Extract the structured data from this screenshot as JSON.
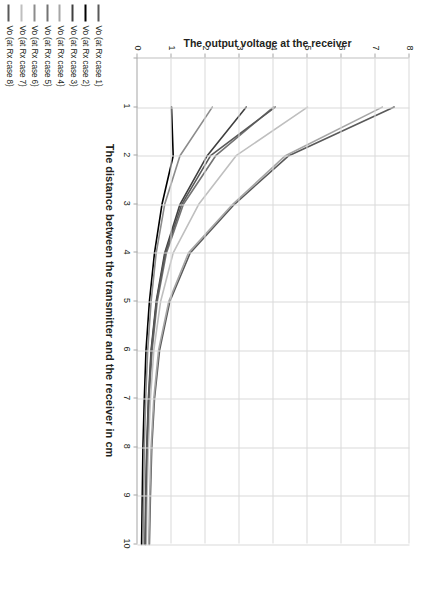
{
  "chart_data": {
    "type": "line",
    "title": "",
    "xlabel": "The distance between the transmitter and the receiver in cm",
    "ylabel": "The output voltage at the receiver",
    "xlim": [
      0,
      10
    ],
    "ylim": [
      0,
      8
    ],
    "xticks": [
      0,
      1,
      2,
      3,
      4,
      5,
      6,
      7,
      8,
      9,
      10
    ],
    "yticks": [
      0,
      1,
      2,
      3,
      4,
      5,
      6,
      7,
      8
    ],
    "grid": true,
    "legend_position": "bottom-left",
    "rotation_deg": 90,
    "x": [
      1,
      2,
      3,
      4,
      5,
      6,
      7,
      8,
      9,
      10
    ],
    "series": [
      {
        "name": "Vo (at Rx case 1)",
        "color": "#595959",
        "values": [
          7.55,
          4.45,
          2.85,
          1.55,
          0.95,
          0.65,
          0.5,
          0.42,
          0.38,
          0.35
        ]
      },
      {
        "name": "Vo (at Rx case 2)",
        "color": "#000000",
        "values": [
          1.0,
          1.05,
          0.72,
          0.5,
          0.35,
          0.25,
          0.2,
          0.16,
          0.14,
          0.12
        ]
      },
      {
        "name": "Vo (at Rx case 3)",
        "color": "#404040",
        "values": [
          3.2,
          2.05,
          1.25,
          0.8,
          0.55,
          0.4,
          0.32,
          0.27,
          0.24,
          0.22
        ]
      },
      {
        "name": "Vo (at Rx case 4)",
        "color": "#a6a6a6",
        "values": [
          7.2,
          4.35,
          2.8,
          1.5,
          0.92,
          0.62,
          0.48,
          0.4,
          0.36,
          0.33
        ]
      },
      {
        "name": "Vo (at Rx case 5)",
        "color": "#737373",
        "values": [
          4.0,
          2.3,
          1.35,
          0.85,
          0.58,
          0.43,
          0.34,
          0.29,
          0.26,
          0.24
        ]
      },
      {
        "name": "Vo (at Rx case 6)",
        "color": "#8c8c8c",
        "values": [
          2.2,
          1.25,
          0.8,
          0.55,
          0.4,
          0.3,
          0.24,
          0.2,
          0.18,
          0.16
        ]
      },
      {
        "name": "Vo (at Rx case 7)",
        "color": "#bfbfbf",
        "values": [
          5.0,
          2.9,
          1.8,
          1.05,
          0.68,
          0.48,
          0.38,
          0.32,
          0.28,
          0.26
        ]
      },
      {
        "name": "Vo (at Rx case 8)",
        "color": "#595959",
        "values": [
          4.05,
          2.15,
          1.3,
          0.82,
          0.56,
          0.41,
          0.33,
          0.28,
          0.25,
          0.23
        ]
      }
    ]
  }
}
